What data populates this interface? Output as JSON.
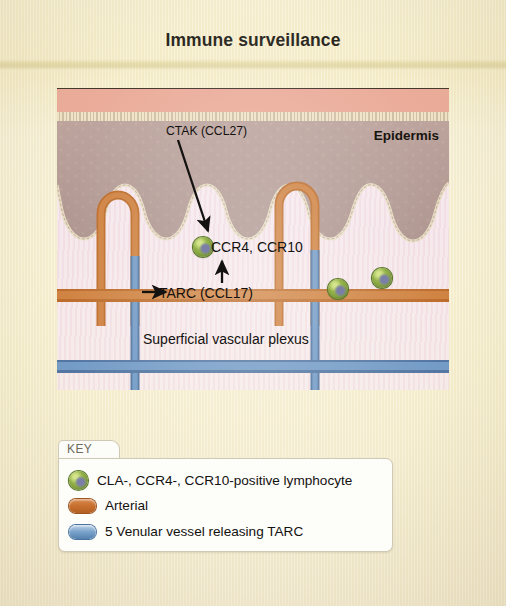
{
  "title": "Immune surveillance",
  "diagram": {
    "epidermis_label": "Epidermis",
    "annotations": {
      "ctak": "CTAK (CCL27)",
      "ccr": "CCR4, CCR10",
      "tarc": "TARC (CCL17)",
      "plexus": "Superficial vascular plexus"
    },
    "colors": {
      "stratum_corneum": "#eaa895",
      "epidermis": "#b49a94",
      "dermis": "#f4e6ec",
      "arterial": "#c8702f",
      "venular": "#5481ae",
      "lymphocyte": "#8fae46",
      "paper": "#f6eeca"
    },
    "lymphocytes": [
      {
        "x": 193,
        "y": 237
      },
      {
        "x": 372,
        "y": 268
      },
      {
        "x": 328,
        "y": 279
      }
    ]
  },
  "key": {
    "tab_label": "KEY",
    "items": [
      {
        "swatch": "lymphocyte-swatch",
        "label": "CLA-, CCR4-, CCR10-positive lymphocyte"
      },
      {
        "swatch": "arterial-swatch",
        "label": "Arterial"
      },
      {
        "swatch": "venular-swatch",
        "label": "5 Venular vessel releasing TARC"
      }
    ]
  }
}
